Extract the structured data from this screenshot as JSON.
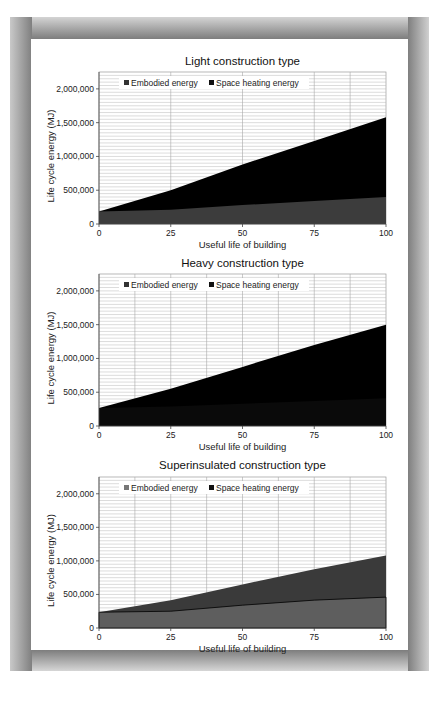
{
  "chart_data": [
    {
      "type": "area",
      "stacked": true,
      "title": "Light construction type",
      "xlabel": "Useful life of building",
      "ylabel": "Life cycle energy (MJ)",
      "x": [
        0,
        25,
        50,
        75,
        100
      ],
      "xticks": [
        "0",
        "25",
        "50",
        "75",
        "100"
      ],
      "yticks": [
        "0",
        "500,000",
        "1,000,000",
        "1,500,000",
        "2,000,000"
      ],
      "ylim": [
        0,
        2250000
      ],
      "xlim": [
        0,
        100
      ],
      "grid": true,
      "legend_position": "top-inside",
      "series": [
        {
          "name": "Embodied energy",
          "color": "#3c3c3c",
          "values": [
            185000,
            210000,
            280000,
            340000,
            400000
          ]
        },
        {
          "name": "Space heating energy",
          "color": "#000000",
          "values": [
            0,
            290000,
            600000,
            890000,
            1180000
          ]
        }
      ],
      "totals": [
        185000,
        500000,
        880000,
        1230000,
        1580000
      ]
    },
    {
      "type": "area",
      "stacked": true,
      "title": "Heavy construction type",
      "xlabel": "Useful life of building",
      "ylabel": "Life cycle energy (MJ)",
      "x": [
        0,
        25,
        50,
        75,
        100
      ],
      "xticks": [
        "0",
        "25",
        "50",
        "75",
        "100"
      ],
      "yticks": [
        "0",
        "500,000",
        "1,000,000",
        "1,500,000",
        "2,000,000"
      ],
      "ylim": [
        0,
        2250000
      ],
      "xlim": [
        0,
        100
      ],
      "grid": true,
      "legend_position": "top-inside",
      "series": [
        {
          "name": "Embodied energy",
          "color": "#0a0a0a",
          "values": [
            265000,
            290000,
            330000,
            370000,
            410000
          ]
        },
        {
          "name": "Space heating energy",
          "color": "#000000",
          "values": [
            0,
            260000,
            545000,
            830000,
            1090000
          ]
        }
      ],
      "totals": [
        265000,
        550000,
        875000,
        1200000,
        1500000
      ]
    },
    {
      "type": "area",
      "stacked": true,
      "title": "Superinsulated construction type",
      "xlabel": "Useful life of building",
      "ylabel": "Life cycle energy (MJ)",
      "x": [
        0,
        25,
        50,
        75,
        100
      ],
      "xticks": [
        "0",
        "25",
        "50",
        "75",
        "100"
      ],
      "yticks": [
        "0",
        "500,000",
        "1,000,000",
        "1,500,000",
        "2,000,000"
      ],
      "ylim": [
        0,
        2250000
      ],
      "xlim": [
        0,
        100
      ],
      "grid": true,
      "legend_position": "top-inside",
      "series": [
        {
          "name": "Embodied energy",
          "color": "#5e5e5e",
          "values": [
            235000,
            250000,
            340000,
            415000,
            460000
          ]
        },
        {
          "name": "Space heating energy",
          "color": "#3a3a3a",
          "values": [
            0,
            165000,
            310000,
            460000,
            620000
          ]
        }
      ],
      "totals": [
        235000,
        415000,
        650000,
        875000,
        1080000
      ]
    }
  ],
  "charts": [
    {
      "title": "Light construction type",
      "xlabel": "Useful life of building",
      "ylabel": "Life cycle energy (MJ)",
      "legend": [
        "Embodied energy",
        "Space heating energy"
      ]
    },
    {
      "title": "Heavy construction type",
      "xlabel": "Useful life of building",
      "ylabel": "Life cycle energy (MJ)",
      "legend": [
        "Embodied energy",
        "Space heating energy"
      ]
    },
    {
      "title": "Superinsulated construction type",
      "xlabel": "Useful life of building",
      "ylabel": "Life cycle energy (MJ)",
      "legend": [
        "Embodied energy",
        "Space heating energy"
      ]
    }
  ]
}
